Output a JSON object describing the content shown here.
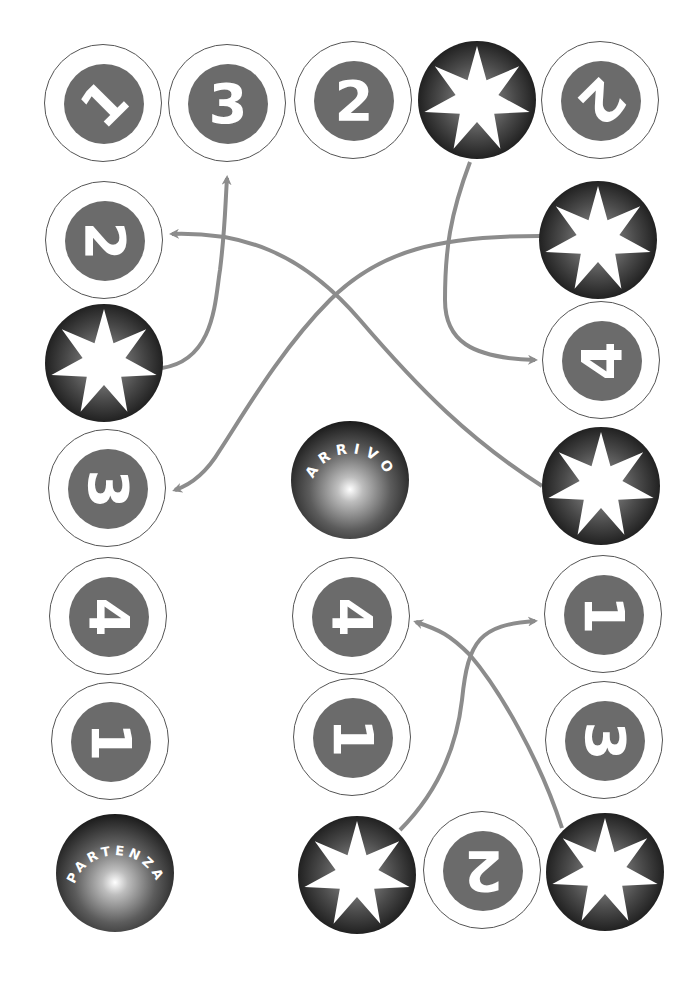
{
  "game": {
    "type": "board-game-path",
    "colors": {
      "background": "#ffffff",
      "number_disc": "#6b6b6b",
      "number_ring": "#555555",
      "arrow": "#8c8c8c",
      "star_dark": "#000000",
      "digit": "#ffffff"
    },
    "start_label": "PARTENZA",
    "finish_label": "ARRIVO",
    "spots": [
      {
        "id": "s1",
        "kind": "number",
        "value": "1",
        "rotation": -45,
        "x": 103,
        "y": 103
      },
      {
        "id": "s2",
        "kind": "number",
        "value": "3",
        "rotation": 0,
        "x": 227,
        "y": 103
      },
      {
        "id": "s3",
        "kind": "number",
        "value": "2",
        "rotation": 0,
        "x": 353,
        "y": 100
      },
      {
        "id": "s4",
        "kind": "star",
        "value": "",
        "rotation": 0,
        "x": 477,
        "y": 100
      },
      {
        "id": "s5",
        "kind": "number",
        "value": "2",
        "rotation": 135,
        "x": 600,
        "y": 100
      },
      {
        "id": "s6",
        "kind": "star",
        "value": "",
        "rotation": 0,
        "x": 598,
        "y": 240
      },
      {
        "id": "s7",
        "kind": "number",
        "value": "4",
        "rotation": -90,
        "x": 601,
        "y": 360
      },
      {
        "id": "s8",
        "kind": "star",
        "value": "",
        "rotation": 0,
        "x": 601,
        "y": 486
      },
      {
        "id": "s9",
        "kind": "number",
        "value": "1",
        "rotation": 90,
        "x": 603,
        "y": 614
      },
      {
        "id": "s10",
        "kind": "number",
        "value": "3",
        "rotation": 90,
        "x": 604,
        "y": 740
      },
      {
        "id": "s11",
        "kind": "star",
        "value": "",
        "rotation": 0,
        "x": 605,
        "y": 872
      },
      {
        "id": "s12",
        "kind": "number",
        "value": "2",
        "rotation": 180,
        "x": 482,
        "y": 870
      },
      {
        "id": "s13",
        "kind": "star",
        "value": "",
        "rotation": 0,
        "x": 357,
        "y": 875
      },
      {
        "id": "s14",
        "kind": "number",
        "value": "1",
        "rotation": 90,
        "x": 352,
        "y": 737
      },
      {
        "id": "s15",
        "kind": "number",
        "value": "4",
        "rotation": 90,
        "x": 351,
        "y": 616
      },
      {
        "id": "s16",
        "kind": "number",
        "value": "2",
        "rotation": 90,
        "x": 104,
        "y": 240
      },
      {
        "id": "s17",
        "kind": "star",
        "value": "",
        "rotation": 0,
        "x": 104,
        "y": 363
      },
      {
        "id": "s18",
        "kind": "number",
        "value": "3",
        "rotation": 90,
        "x": 107,
        "y": 488
      },
      {
        "id": "s19",
        "kind": "number",
        "value": "4",
        "rotation": 90,
        "x": 108,
        "y": 616
      },
      {
        "id": "s20",
        "kind": "number",
        "value": "1",
        "rotation": 90,
        "x": 110,
        "y": 741
      }
    ],
    "start": {
      "x": 115,
      "y": 873
    },
    "finish": {
      "x": 350,
      "y": 480
    },
    "arrows": [
      {
        "from": "star s17",
        "to": "number 3 (top row)",
        "path": "M 162 368 C 215 360 215 300 220 270 C 225 230 225 210 227 178"
      },
      {
        "from": "star s8",
        "to": "number 2 (left column)",
        "path": "M 542 486 C 470 440 420 390 360 320 C 300 250 240 232 172 234"
      },
      {
        "from": "star s6",
        "to": "number 3 (left column)",
        "path": "M 540 236 C 440 236 380 250 330 300 C 280 350 240 420 220 450 C 205 475 190 485 175 490"
      },
      {
        "from": "star s4",
        "to": "number 4 (right column)",
        "path": "M 470 162 C 450 215 445 250 445 300 C 445 340 470 358 535 360"
      },
      {
        "from": "star s13",
        "to": "number 1 (right column)",
        "path": "M 400 830 C 430 800 455 760 462 700 C 468 640 480 625 535 621"
      },
      {
        "from": "star s11",
        "to": "number 4 (middle)",
        "path": "M 562 828 C 540 760 500 690 470 655 C 450 635 440 630 416 622"
      }
    ]
  }
}
